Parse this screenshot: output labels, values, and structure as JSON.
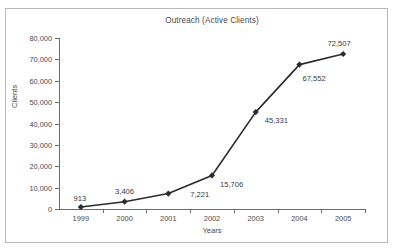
{
  "chart_data": {
    "type": "line",
    "title": "Outreach (Active Clients)",
    "xlabel": "Years",
    "ylabel": "Clients",
    "categories": [
      "1999",
      "2000",
      "2001",
      "2002",
      "2003",
      "2004",
      "2005"
    ],
    "values": [
      913,
      3406,
      7221,
      15706,
      45331,
      67552,
      72507
    ],
    "point_labels": [
      "913",
      "3,406",
      "7,221",
      "15,706",
      "45,331",
      "67,552",
      "72,507"
    ],
    "ylim": [
      0,
      80000
    ],
    "ytick_values": [
      0,
      10000,
      20000,
      30000,
      40000,
      50000,
      60000,
      70000,
      80000
    ],
    "ytick_labels": [
      "0",
      "10,000",
      "20,000",
      "30,000",
      "40,000",
      "50,000",
      "60,000",
      "70,000",
      "80,000"
    ],
    "grid": false,
    "legend": null,
    "legend_position": "none",
    "series_color": "#2b2b2b",
    "marker": "diamond",
    "axis_color": "#6e6e6e",
    "frame_color": "#b9b9b9",
    "background": "#ffffff"
  },
  "labels": {
    "label_offsets": [
      {
        "dx": -1,
        "dy": -13,
        "align": "center"
      },
      {
        "dx": 0,
        "dy": -15,
        "align": "center"
      },
      {
        "dx": 22,
        "dy": -4,
        "align": "left"
      },
      {
        "dx": 8,
        "dy": 5,
        "align": "left"
      },
      {
        "dx": 9,
        "dy": 4,
        "align": "left"
      },
      {
        "dx": 3,
        "dy": 9,
        "align": "left"
      },
      {
        "dx": -4,
        "dy": -15,
        "align": "center"
      }
    ]
  }
}
